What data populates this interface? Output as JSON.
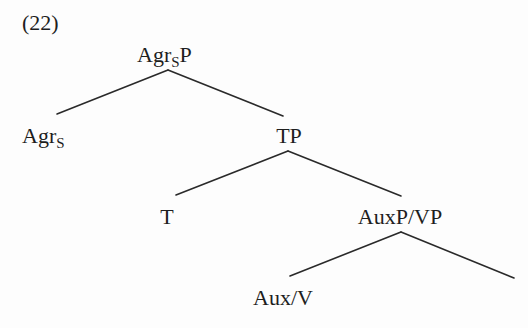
{
  "example_number": "(22)",
  "tree": {
    "nodes": [
      {
        "id": "agrsp",
        "label": "Agr",
        "subscript": "S",
        "suffix": "P"
      },
      {
        "id": "agrs",
        "label": "Agr",
        "subscript": "S",
        "suffix": ""
      },
      {
        "id": "tp",
        "label": "TP",
        "subscript": "",
        "suffix": ""
      },
      {
        "id": "t",
        "label": "T",
        "subscript": "",
        "suffix": ""
      },
      {
        "id": "auxpvp",
        "label": "AuxP/VP",
        "subscript": "",
        "suffix": ""
      },
      {
        "id": "auxv",
        "label": "Aux/V",
        "subscript": "",
        "suffix": ""
      },
      {
        "id": "complement",
        "label": "",
        "subscript": "",
        "suffix": ""
      }
    ],
    "edges": [
      {
        "from": "agrsp",
        "to": "agrs"
      },
      {
        "from": "agrsp",
        "to": "tp"
      },
      {
        "from": "tp",
        "to": "t"
      },
      {
        "from": "tp",
        "to": "auxpvp"
      },
      {
        "from": "auxpvp",
        "to": "auxv"
      },
      {
        "from": "auxpvp",
        "to": "complement"
      }
    ]
  },
  "colors": {
    "ink": "#1e1e1e",
    "background": "#fdfdfd"
  }
}
